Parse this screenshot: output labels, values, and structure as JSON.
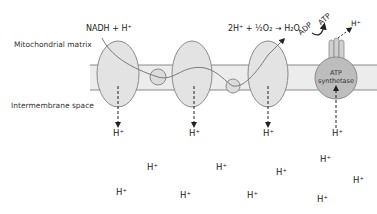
{
  "regions": {
    "matrix_label": "Mitochondrial matrix",
    "intermembrane_label": "Intermembrane space"
  },
  "reactions": {
    "nadh": "NADH + H⁺",
    "oxygen": "2H⁺ + ½O₂ → H₂O"
  },
  "atp_synthase": {
    "label_line1": "ATP",
    "label_line2": "synthetase",
    "adp": "ADP",
    "atp": "ATP",
    "proton_out": "H⁺"
  },
  "protons": {
    "pumped": [
      "H⁺",
      "H⁺",
      "H⁺",
      "H⁺"
    ],
    "scattered": [
      "H⁺",
      "H⁺",
      "H⁺",
      "H⁺",
      "H⁺",
      "H⁺",
      "H⁺",
      "H⁺",
      "H⁺"
    ]
  },
  "colors": {
    "membrane_fill": "#ececec",
    "complex_fill": "#e3e3e3",
    "outline": "#8a8a8a",
    "atp_synthase_fill": "#bdbdbd",
    "arrow": "#222222"
  }
}
